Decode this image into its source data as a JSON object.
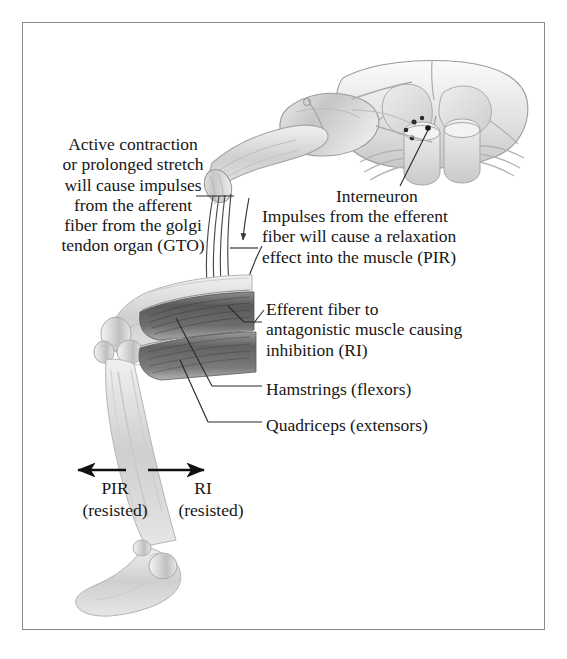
{
  "figure": {
    "border_color": "#8a8a8a",
    "background": "#ffffff",
    "ink_color": "#161616"
  },
  "labels": {
    "afferent_note": "Active contraction\nor prolonged stretch\nwill cause impulses\nfrom the afferent\nfiber from the golgi\ntendon organ (GTO)",
    "interneuron": "Interneuron",
    "efferent_pir_note": "Impulses from the efferent\nfiber will cause a relaxation\neffect into the muscle (PIR)",
    "efferent_ri_note": "Efferent fiber to\nantagonistic muscle causing\ninhibition (RI)",
    "hamstrings": "Hamstrings (flexors)",
    "quadriceps": "Quadriceps (extensors)",
    "pir": "PIR",
    "pir_sub": "(resisted)",
    "ri": "RI",
    "ri_sub": "(resisted)"
  },
  "anatomy": {
    "spinal_cord": "spinal-cord-cross-section",
    "dorsal_root_ganglion": "dorsal-root-ganglion",
    "nerve_fibers": "afferent-and-efferent-nerve-fibers",
    "leg": "flexed-leg-with-hamstring-and-quadriceps",
    "foot": "foot-plantar-flexed"
  },
  "arrows": {
    "pir_direction": "left",
    "ri_direction": "right",
    "impulse_flow": "downward-along-nerve-fibers"
  }
}
